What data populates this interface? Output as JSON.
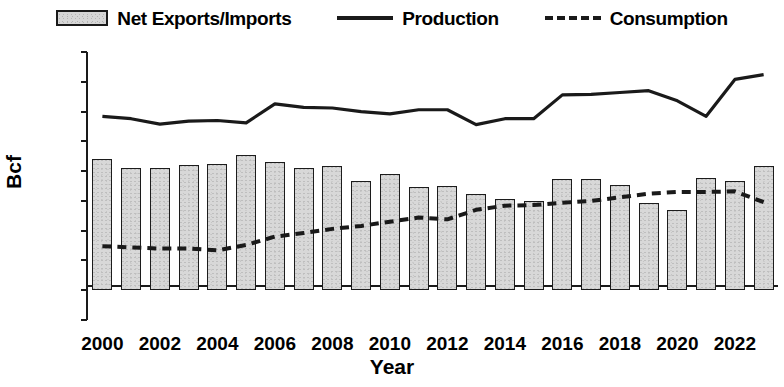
{
  "legend": {
    "items": [
      {
        "name": "bars",
        "label": "Net Exports/Imports",
        "marker": "filled-rect"
      },
      {
        "name": "production",
        "label": "Production",
        "marker": "solid-line"
      },
      {
        "name": "consumption",
        "label": "Consumption",
        "marker": "dashed-line"
      }
    ]
  },
  "axes": {
    "ylabel": "Bcf",
    "xlabel": "Year",
    "yticks": [
      "4000",
      "3500",
      "3000",
      "2500",
      "2000",
      "1500",
      "1000",
      "500",
      "0",
      "-500"
    ],
    "xticks": [
      "2000",
      "2002",
      "2004",
      "2006",
      "2008",
      "2010",
      "2012",
      "2014",
      "2016",
      "2018",
      "2020",
      "2022"
    ]
  },
  "colors": {
    "bar_fill": "#d8d8d8",
    "bar_border": "#1c1c1c",
    "line": "#1a1a1a",
    "background": "#ffffff"
  },
  "chart_data": {
    "type": "bar",
    "title": "",
    "xlabel": "Year",
    "ylabel": "Bcf",
    "ylim": [
      -500,
      4000
    ],
    "ytick_step": 500,
    "grid": false,
    "legend_position": "top",
    "categories": [
      "2000",
      "2001",
      "2002",
      "2003",
      "2004",
      "2005",
      "2006",
      "2007",
      "2008",
      "2009",
      "2010",
      "2011",
      "2012",
      "2013",
      "2014",
      "2015",
      "2016",
      "2017",
      "2018",
      "2019",
      "2020",
      "2021",
      "2022",
      "2023"
    ],
    "series": [
      {
        "name": "Net Exports/Imports",
        "type": "bar",
        "values": [
          2200,
          2050,
          2060,
          2100,
          2120,
          2270,
          2150,
          2060,
          2080,
          1840,
          1950,
          1740,
          1750,
          1610,
          1530,
          1500,
          1860,
          1860,
          1760,
          1470,
          1350,
          1880,
          1840,
          2080
        ]
      },
      {
        "name": "Production",
        "type": "line",
        "style": "solid",
        "values": [
          2920,
          2880,
          2790,
          2840,
          2850,
          2810,
          3130,
          3070,
          3060,
          3000,
          2960,
          3030,
          3030,
          2780,
          2880,
          2880,
          3280,
          3290,
          3320,
          3350,
          3180,
          2920,
          3540,
          3620
        ]
      },
      {
        "name": "Consumption",
        "type": "line",
        "style": "dashed",
        "values": [
          740,
          720,
          700,
          700,
          670,
          760,
          900,
          960,
          1030,
          1080,
          1150,
          1220,
          1190,
          1350,
          1420,
          1430,
          1470,
          1500,
          1560,
          1620,
          1650,
          1650,
          1660,
          1480
        ]
      }
    ]
  }
}
